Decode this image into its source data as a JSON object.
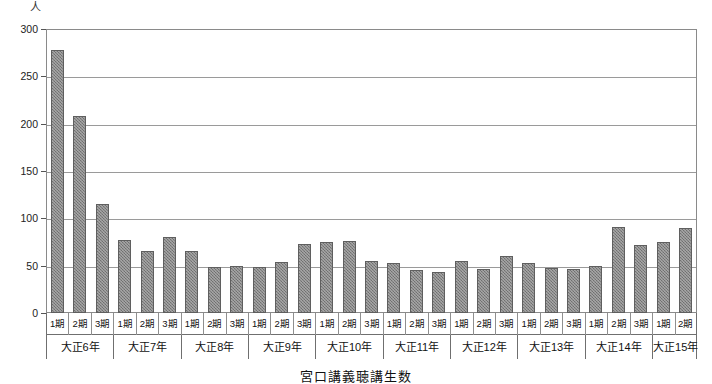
{
  "caption": "宮口講義聴講生数",
  "chart_data": {
    "type": "bar",
    "title": "宮口講義聴講生数",
    "xlabel": "",
    "ylabel": "人",
    "yunit": "人",
    "ylim": [
      0,
      300
    ],
    "yticks": [
      300,
      250,
      200,
      150,
      100,
      50,
      0
    ],
    "grid": true,
    "legend": "none",
    "bar_color": "#808080",
    "categories": [
      "大正6年 1期",
      "大正6年 2期",
      "大正6年 3期",
      "大正7年 1期",
      "大正7年 2期",
      "大正7年 3期",
      "大正8年 1期",
      "大正8年 2期",
      "大正8年 3期",
      "大正9年 1期",
      "大正9年 2期",
      "大正9年 3期",
      "大正10年 1期",
      "大正10年 2期",
      "大正10年 3期",
      "大正11年 1期",
      "大正11年 2期",
      "大正11年 3期",
      "大正12年 1期",
      "大正12年 2期",
      "大正12年 3期",
      "大正13年 1期",
      "大正13年 2期",
      "大正13年 3期",
      "大正14年 1期",
      "大正14年 2期",
      "大正14年 3期",
      "大正15年 1期",
      "大正15年 2期"
    ],
    "values": [
      278,
      208,
      115,
      77,
      65,
      80,
      65,
      49,
      50,
      49,
      54,
      73,
      75,
      76,
      55,
      53,
      45,
      43,
      55,
      46,
      60,
      53,
      48,
      46,
      50,
      91,
      72,
      75,
      90
    ]
  },
  "groups": [
    {
      "year": "大正6年",
      "periods": [
        "1期",
        "2期",
        "3期"
      ],
      "values": [
        278,
        208,
        115
      ]
    },
    {
      "year": "大正7年",
      "periods": [
        "1期",
        "2期",
        "3期"
      ],
      "values": [
        77,
        65,
        80
      ]
    },
    {
      "year": "大正8年",
      "periods": [
        "1期",
        "2期",
        "3期"
      ],
      "values": [
        65,
        49,
        50
      ]
    },
    {
      "year": "大正9年",
      "periods": [
        "1期",
        "2期",
        "3期"
      ],
      "values": [
        49,
        54,
        73
      ]
    },
    {
      "year": "大正10年",
      "periods": [
        "1期",
        "2期",
        "3期"
      ],
      "values": [
        75,
        76,
        55
      ]
    },
    {
      "year": "大正11年",
      "periods": [
        "1期",
        "2期",
        "3期"
      ],
      "values": [
        53,
        45,
        43
      ]
    },
    {
      "year": "大正12年",
      "periods": [
        "1期",
        "2期",
        "3期"
      ],
      "values": [
        55,
        46,
        60
      ]
    },
    {
      "year": "大正13年",
      "periods": [
        "1期",
        "2期",
        "3期"
      ],
      "values": [
        53,
        48,
        46
      ]
    },
    {
      "year": "大正14年",
      "periods": [
        "1期",
        "2期",
        "3期"
      ],
      "values": [
        50,
        91,
        72
      ]
    },
    {
      "year": "大正15年",
      "periods": [
        "1期",
        "2期"
      ],
      "values": [
        75,
        90
      ]
    }
  ]
}
